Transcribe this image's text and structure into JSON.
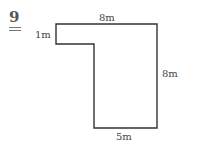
{
  "question": {
    "number": "9"
  },
  "diagram": {
    "shape": "L-shaped polygon",
    "stroke_color": "#333333",
    "labels": {
      "top": "8m",
      "left_step": "1m",
      "right": "8m",
      "bottom": "5m"
    }
  }
}
